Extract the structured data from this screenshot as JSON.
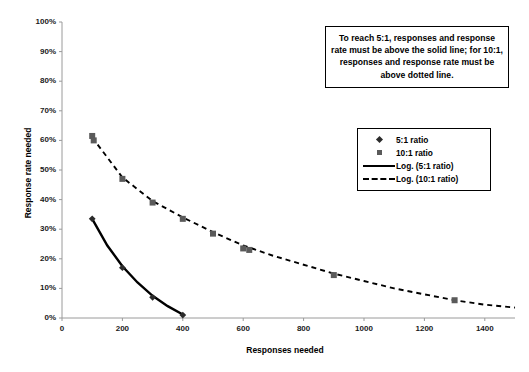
{
  "chart_data": {
    "type": "scatter",
    "title": "",
    "xlabel": "Responses needed",
    "ylabel": "Response rate needed",
    "xlim": [
      0,
      1500
    ],
    "ylim": [
      0,
      1.0
    ],
    "xticks": [
      "0",
      "200",
      "400",
      "600",
      "800",
      "1000",
      "1200",
      "1400"
    ],
    "xtick_values": [
      0,
      200,
      400,
      600,
      800,
      1000,
      1200,
      1400
    ],
    "yticks": [
      "0%",
      "10%",
      "20%",
      "30%",
      "40%",
      "50%",
      "60%",
      "70%",
      "80%",
      "90%",
      "100%"
    ],
    "ytick_values": [
      0,
      10,
      20,
      30,
      40,
      50,
      60,
      70,
      80,
      90,
      100
    ],
    "grid": false,
    "legend_position": "right-middle",
    "series": [
      {
        "name": "5:1 ratio",
        "marker": "diamond",
        "color": "#2b2b2b",
        "points": [
          {
            "x": 100,
            "y": 33.5
          },
          {
            "x": 200,
            "y": 17.0
          },
          {
            "x": 300,
            "y": 7.0
          },
          {
            "x": 400,
            "y": 1.0
          }
        ]
      },
      {
        "name": "10:1 ratio",
        "marker": "square",
        "color": "#5a5a5a",
        "points": [
          {
            "x": 100,
            "y": 61.5
          },
          {
            "x": 105,
            "y": 60.0
          },
          {
            "x": 200,
            "y": 47.0
          },
          {
            "x": 300,
            "y": 39.0
          },
          {
            "x": 400,
            "y": 33.5
          },
          {
            "x": 500,
            "y": 28.5
          },
          {
            "x": 600,
            "y": 23.5
          },
          {
            "x": 620,
            "y": 23.0
          },
          {
            "x": 900,
            "y": 14.5
          },
          {
            "x": 1300,
            "y": 6.0
          }
        ]
      },
      {
        "name": "Log. (5:1 ratio)",
        "type": "trendline",
        "style": "solid",
        "color": "#000000",
        "points": [
          {
            "x": 100,
            "y": 33.5
          },
          {
            "x": 150,
            "y": 24.5
          },
          {
            "x": 200,
            "y": 17.5
          },
          {
            "x": 250,
            "y": 12.0
          },
          {
            "x": 300,
            "y": 7.5
          },
          {
            "x": 350,
            "y": 4.0
          },
          {
            "x": 400,
            "y": 1.2
          }
        ]
      },
      {
        "name": "Log. (10:1 ratio)",
        "type": "trendline",
        "style": "dashed",
        "color": "#000000",
        "points": [
          {
            "x": 100,
            "y": 61.0
          },
          {
            "x": 200,
            "y": 47.5
          },
          {
            "x": 300,
            "y": 39.5
          },
          {
            "x": 400,
            "y": 34.0
          },
          {
            "x": 500,
            "y": 29.0
          },
          {
            "x": 600,
            "y": 24.5
          },
          {
            "x": 700,
            "y": 21.0
          },
          {
            "x": 800,
            "y": 18.0
          },
          {
            "x": 900,
            "y": 15.0
          },
          {
            "x": 1000,
            "y": 12.5
          },
          {
            "x": 1100,
            "y": 10.0
          },
          {
            "x": 1200,
            "y": 8.0
          },
          {
            "x": 1300,
            "y": 6.0
          },
          {
            "x": 1400,
            "y": 4.5
          },
          {
            "x": 1500,
            "y": 3.5
          }
        ]
      }
    ],
    "annotations": [
      {
        "name": "threshold-note",
        "text": "To reach 5:1, responses and response rate must be above the solid line; for 10:1, responses and response rate must be above dotted line."
      }
    ]
  },
  "legend": {
    "items": [
      {
        "label": "5:1 ratio",
        "key": "diamond-marker-icon"
      },
      {
        "label": "10:1 ratio",
        "key": "square-marker-icon"
      },
      {
        "label": "Log. (5:1 ratio)",
        "key": "solid-line-icon"
      },
      {
        "label": "Log. (10:1 ratio)",
        "key": "dashed-line-icon"
      }
    ]
  },
  "colors": {
    "axis": "#9a9a9a",
    "text": "#1a1a1a",
    "series_5_1": "#2b2b2b",
    "series_10_1": "#5a5a5a",
    "trend": "#000000",
    "background": "#ffffff"
  }
}
